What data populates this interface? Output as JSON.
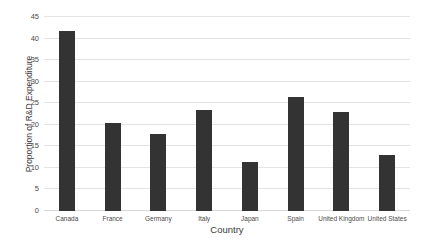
{
  "chart_data": {
    "type": "bar",
    "title": "",
    "xlabel": "Country",
    "ylabel": "Proportion of R&D Expenditure",
    "categories": [
      "Canada",
      "France",
      "Germany",
      "Italy",
      "Japan",
      "Spain",
      "United Kingdom",
      "United States"
    ],
    "values": [
      41.8,
      20.4,
      17.9,
      23.4,
      11.3,
      26.5,
      23.0,
      13.0
    ],
    "ylim": [
      0,
      45
    ],
    "yticks": [
      0,
      5,
      10,
      15,
      20,
      25,
      30,
      35,
      40,
      45
    ],
    "ytick_labels": [
      "0",
      "5",
      "10",
      "15",
      "20",
      "25",
      "30",
      "35",
      "40",
      "45"
    ],
    "grid": true,
    "legend": false,
    "bar_color": "#333333",
    "grid_color": "#e4e4e4",
    "background": "#ffffff"
  }
}
